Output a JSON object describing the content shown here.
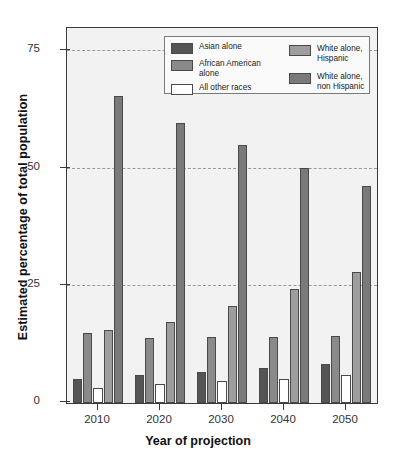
{
  "chart_data": {
    "type": "bar",
    "title": "",
    "xlabel": "Year of projection",
    "ylabel": "Estimated percentage of total population",
    "categories": [
      "2010",
      "2020",
      "2030",
      "2040",
      "2050"
    ],
    "ylim": [
      0,
      80
    ],
    "yticks": [
      0,
      25,
      50,
      75
    ],
    "ytick_labels": [
      "0",
      "25",
      "50",
      "75"
    ],
    "grid": "horizontal-dashed",
    "legend_position": "top-center-inside",
    "series": [
      {
        "name": "Asian alone",
        "color": "#555555",
        "values": [
          5.1,
          5.9,
          6.6,
          7.4,
          8.4
        ]
      },
      {
        "name": "African American alone",
        "color": "#8a8a8a",
        "values": [
          14.9,
          13.9,
          14.0,
          14.1,
          14.2
        ]
      },
      {
        "name": "All other races",
        "color": "#ffffff",
        "values": [
          3.1,
          4.0,
          4.6,
          5.2,
          6.0
        ]
      },
      {
        "name": "White alone,\nHispanic",
        "color": "#9e9e9e",
        "values": [
          15.5,
          17.2,
          20.7,
          24.4,
          28.0
        ]
      },
      {
        "name": "White alone,\nnon Hispanic",
        "color": "#7a7a7a",
        "values": [
          65.5,
          59.7,
          55.0,
          50.1,
          46.3
        ]
      }
    ]
  },
  "axis": {
    "frame_color": "#3a3a3a",
    "plot_background": "#f2f2f2",
    "gridline_color": "#9a9a9a"
  }
}
